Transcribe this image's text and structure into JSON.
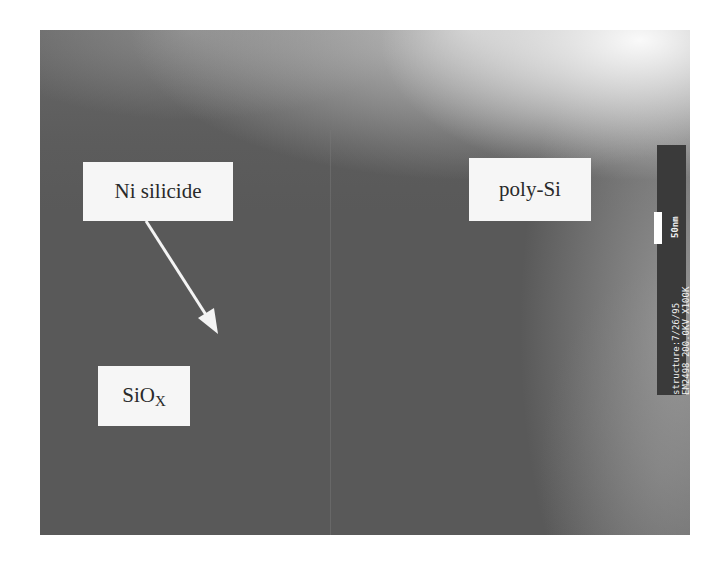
{
  "figure": {
    "type": "TEM cross-section micrograph",
    "labels": {
      "ni_silicide": "Ni silicide",
      "poly_si": "poly-Si",
      "siox_base": "SiO",
      "siox_sub": "X"
    },
    "arrow": {
      "from_label": "Ni silicide",
      "direction": "down-right"
    },
    "scale_bar": {
      "length": "50nm",
      "line1": "structure:7/26/95",
      "line2": "EM2498 200.0KV X100K"
    },
    "colors": {
      "background": "#ffffff",
      "micrograph_dark": "#595959",
      "micrograph_light": "#d8d8d8",
      "label_box": "#f6f6f6",
      "label_text": "#2a2a2a",
      "scale_strip": "#3a3a3a"
    }
  }
}
